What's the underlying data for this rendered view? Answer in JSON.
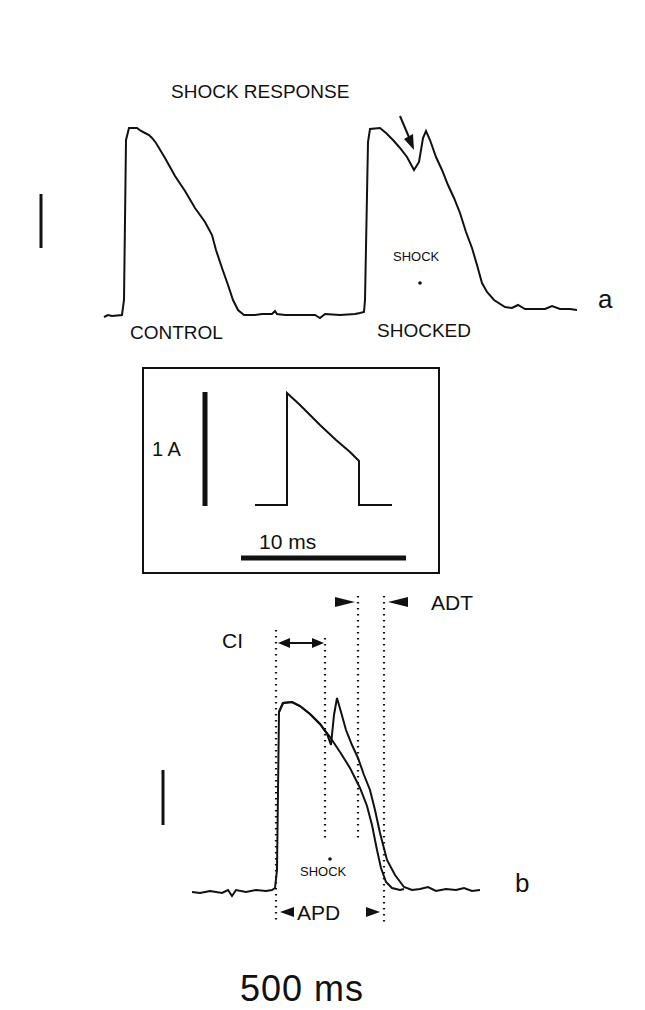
{
  "panel_a": {
    "annotation": "SHOCK RESPONSE",
    "shock_marker": "SHOCK",
    "control_label": "CONTROL",
    "shocked_label": "SHOCKED",
    "panel_label": "a"
  },
  "inset": {
    "current_scale": "1 A",
    "time_scale": "10 ms"
  },
  "panel_b": {
    "ci_label": "CI",
    "adt_label": "ADT",
    "shock_marker": "SHOCK",
    "apd_label": "APD",
    "panel_label": "b"
  },
  "time_scale_bar": "500 ms"
}
